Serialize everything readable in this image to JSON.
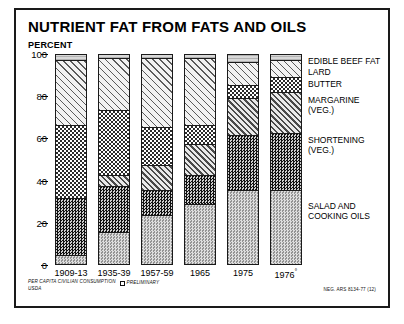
{
  "chart": {
    "title": "NUTRIENT FAT FROM FATS AND OILS",
    "y_axis_unit": "PERCENT"
  },
  "footer": {
    "source_line": "PER CAPITA CIVILIAN CONSUMPTION",
    "agency": "USDA",
    "preliminary_note": "PRELIMINARY",
    "neg_code": "NEG. ARS 8134-77 (12)"
  },
  "legend": [
    {
      "label": "EDIBLE BEEF FAT",
      "sub": "",
      "key": "edible_beef_fat",
      "pattern": "fine-horizontal-stipple",
      "top": 3
    },
    {
      "label": "LARD",
      "sub": "",
      "key": "lard",
      "pattern": "sparse-diagonal-hatch",
      "top": 14
    },
    {
      "label": "BUTTER",
      "sub": "",
      "key": "butter",
      "pattern": "medium-checkerboard",
      "top": 26
    },
    {
      "label": "MARGARINE",
      "sub": "(VEG.)",
      "key": "margarine",
      "pattern": "dense-diagonal-hatch",
      "top": 42
    },
    {
      "label": "SHORTENING",
      "sub": "(VEG.)",
      "key": "shortening",
      "pattern": "dark-checkerboard",
      "top": 82
    },
    {
      "label": "SALAD AND",
      "sub": "COOKING OILS",
      "key": "salad_and_cooking_oils",
      "pattern": "grey-stipple",
      "top": 148
    }
  ],
  "chart_data": {
    "type": "bar",
    "subtype": "stacked-100-percent",
    "title": "NUTRIENT FAT FROM FATS AND OILS",
    "xlabel": "",
    "ylabel": "PERCENT",
    "ylim": [
      0,
      100
    ],
    "yticks": [
      0,
      20,
      40,
      60,
      80,
      100
    ],
    "grid": false,
    "legend_position": "right",
    "categories": [
      "1909-13",
      "1935-39",
      "1957-59",
      "1965",
      "1975",
      "1976°"
    ],
    "series": [
      {
        "name": "SALAD AND COOKING OILS",
        "key": "salad",
        "values": [
          4,
          15,
          23,
          28,
          35,
          35
        ]
      },
      {
        "name": "SHORTENING (VEG.)",
        "key": "shortening",
        "values": [
          27,
          22,
          12,
          14,
          26,
          27
        ]
      },
      {
        "name": "MARGARINE (VEG.)",
        "key": "margarine",
        "values": [
          0,
          5,
          12,
          15,
          18,
          20
        ]
      },
      {
        "name": "BUTTER",
        "key": "butter",
        "values": [
          35,
          31,
          18,
          9,
          6,
          7
        ]
      },
      {
        "name": "LARD",
        "key": "lard",
        "values": [
          31,
          25,
          33,
          32,
          11,
          8
        ]
      },
      {
        "name": "EDIBLE BEEF FAT",
        "key": "beeffat",
        "values": [
          3,
          2,
          2,
          2,
          4,
          3
        ]
      }
    ],
    "annotations": [
      "° PRELIMINARY"
    ]
  }
}
